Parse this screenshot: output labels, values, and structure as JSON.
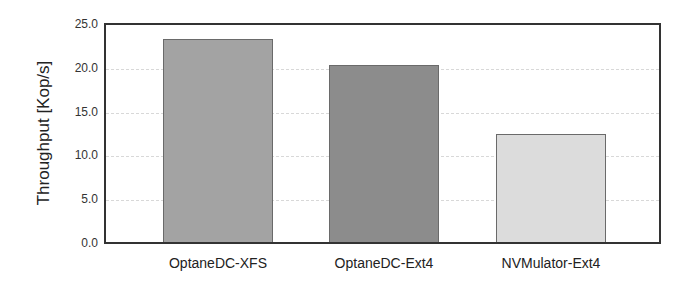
{
  "chart_data": {
    "type": "bar",
    "title": "",
    "xlabel": "",
    "ylabel": "Throughput [Kop/s]",
    "categories": [
      "OptaneDC-XFS",
      "OptaneDC-Ext4",
      "NVMulator-Ext4"
    ],
    "values": [
      23.2,
      20.2,
      12.3
    ],
    "colors": [
      "#a3a3a3",
      "#8c8c8c",
      "#dcdcdc"
    ],
    "ylim": [
      0,
      25
    ],
    "yticks": [
      "0.0",
      "5.0",
      "10.0",
      "15.0",
      "20.0",
      "25.0"
    ],
    "grid": true,
    "legend": null
  }
}
